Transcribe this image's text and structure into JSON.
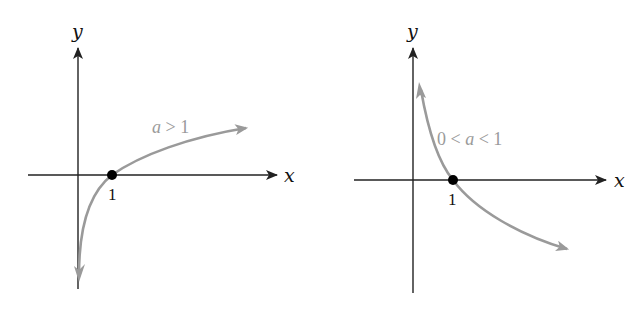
{
  "colors": {
    "axis": "#222222",
    "curve": "#9a9a9a",
    "point": "#000000",
    "background": "#ffffff"
  },
  "panels": [
    {
      "id": "left",
      "x_axis_label": "x",
      "y_axis_label": "y",
      "tick_label": "1",
      "curve_label_prefix": "",
      "curve_label_var": "a",
      "curve_label_suffix": " > 1",
      "description": "Logarithmic function y = log_a(x) with a > 1: increasing, passes through (1, 0)"
    },
    {
      "id": "right",
      "x_axis_label": "x",
      "y_axis_label": "y",
      "tick_label": "1",
      "curve_label_prefix": "0 < ",
      "curve_label_var": "a",
      "curve_label_suffix": " < 1",
      "description": "Logarithmic function y = log_a(x) with 0 < a < 1: decreasing, passes through (1, 0)"
    }
  ]
}
